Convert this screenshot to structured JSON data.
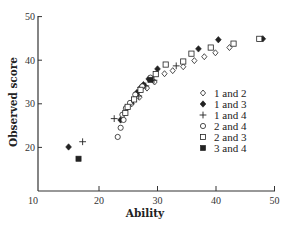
{
  "chart_data": {
    "type": "scatter",
    "title": "",
    "xlabel": "Ability",
    "ylabel": "Observed score",
    "xlim": [
      10,
      50
    ],
    "ylim": [
      10,
      50
    ],
    "xticks": [
      10,
      20,
      30,
      40,
      50
    ],
    "yticks": [
      20,
      30,
      40,
      50
    ],
    "grid": false,
    "legend_position": "right-middle inside",
    "series": [
      {
        "name": "1 and 2",
        "marker": "open-diamond",
        "points": [
          [
            42.3,
            42.9
          ],
          [
            39.9,
            41.7
          ],
          [
            38.0,
            40.8
          ],
          [
            36.3,
            39.9
          ],
          [
            34.4,
            38.5
          ],
          [
            32.6,
            37.6
          ],
          [
            31.2,
            36.9
          ],
          [
            29.5,
            35.0
          ],
          [
            28.2,
            33.6
          ],
          [
            26.9,
            31.5
          ],
          [
            25.6,
            30.0
          ]
        ]
      },
      {
        "name": "1 and 3",
        "marker": "filled-diamond",
        "points": [
          [
            48.0,
            44.9
          ],
          [
            40.4,
            44.7
          ],
          [
            37.0,
            42.6
          ],
          [
            30.0,
            38.0
          ],
          [
            28.5,
            35.7
          ],
          [
            27.6,
            34.4
          ],
          [
            27.1,
            33.7
          ],
          [
            26.5,
            32.6
          ],
          [
            23.7,
            26.3
          ],
          [
            14.8,
            20.1
          ]
        ]
      },
      {
        "name": "1 and 4",
        "marker": "plus",
        "points": [
          [
            33.2,
            38.7
          ],
          [
            29.4,
            35.4
          ],
          [
            28.0,
            34.1
          ],
          [
            26.8,
            31.8
          ],
          [
            25.9,
            30.6
          ],
          [
            22.6,
            26.6
          ],
          [
            17.2,
            21.3
          ]
        ]
      },
      {
        "name": "2 and 4",
        "marker": "open-circle",
        "points": [
          [
            28.8,
            36.0
          ],
          [
            27.4,
            34.0
          ],
          [
            26.2,
            32.1
          ],
          [
            25.3,
            30.2
          ],
          [
            24.6,
            29.0
          ],
          [
            24.2,
            26.3
          ],
          [
            24.0,
            27.5
          ],
          [
            23.7,
            24.5
          ],
          [
            23.2,
            22.4
          ]
        ]
      },
      {
        "name": "2 and 3",
        "marker": "open-square",
        "points": [
          [
            47.4,
            44.9
          ],
          [
            43.0,
            43.8
          ],
          [
            39.1,
            42.9
          ],
          [
            35.8,
            41.5
          ],
          [
            34.4,
            39.7
          ],
          [
            31.4,
            39.0
          ],
          [
            29.7,
            36.8
          ],
          [
            27.1,
            33.2
          ],
          [
            26.0,
            31.0
          ],
          [
            24.9,
            29.3
          ],
          [
            24.5,
            27.9
          ]
        ]
      },
      {
        "name": "3 and 4",
        "marker": "filled-square",
        "points": [
          [
            28.8,
            35.5
          ],
          [
            16.5,
            17.4
          ]
        ]
      }
    ]
  },
  "axes": {
    "x_title": "Ability",
    "y_title": "Observed score",
    "x_tick_labels": [
      "10",
      "20",
      "30",
      "40",
      "50"
    ],
    "y_tick_labels": [
      "20",
      "30",
      "40",
      "50"
    ]
  },
  "legend": {
    "items": [
      {
        "label": "1 and 2",
        "marker": "open-diamond"
      },
      {
        "label": "1 and 3",
        "marker": "filled-diamond"
      },
      {
        "label": "1 and 4",
        "marker": "plus"
      },
      {
        "label": "2 and 4",
        "marker": "open-circle"
      },
      {
        "label": "2 and 3",
        "marker": "open-square"
      },
      {
        "label": "3 and 4",
        "marker": "filled-square"
      }
    ]
  },
  "colors": {
    "ink": "#222222",
    "axis": "#333333",
    "background": "#ffffff"
  }
}
